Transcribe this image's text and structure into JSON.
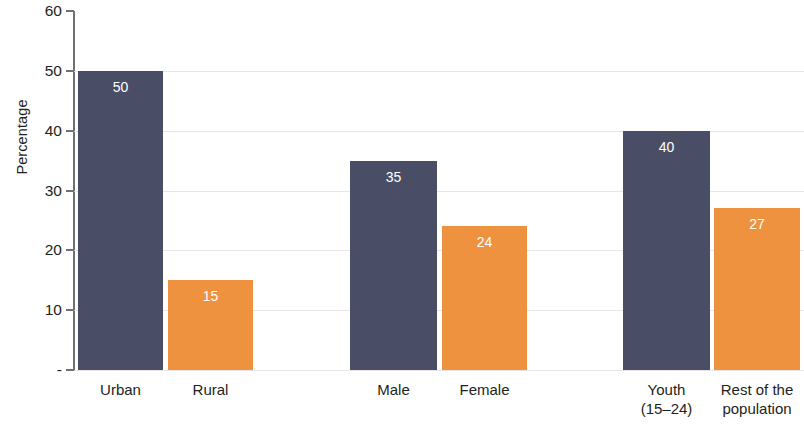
{
  "chart_data": {
    "type": "bar",
    "title": "",
    "xlabel": "",
    "ylabel": "Percentage",
    "ylim": [
      0,
      60
    ],
    "ytick_values": [
      60,
      50,
      40,
      30,
      20,
      10,
      0
    ],
    "ytick_labels": [
      "60",
      "50",
      "40",
      "30",
      "20",
      "10",
      "-"
    ],
    "grid": true,
    "legend": "none",
    "categories": [
      "Urban",
      "Rural",
      "Male",
      "Female",
      "Youth (15–24)",
      "Rest of the population"
    ],
    "category_lines": [
      [
        "Urban"
      ],
      [
        "Rural"
      ],
      [
        "Male"
      ],
      [
        "Female"
      ],
      [
        "Youth",
        "(15–24)"
      ],
      [
        "Rest of the",
        "population"
      ]
    ],
    "values": [
      50,
      15,
      35,
      24,
      40,
      27
    ],
    "data_labels": [
      "50",
      "15",
      "35",
      "24",
      "40",
      "27"
    ],
    "bar_colors": [
      "#4a4d66",
      "#ef9240",
      "#4a4d66",
      "#ef9240",
      "#4a4d66",
      "#ef9240"
    ]
  },
  "colors": {
    "navy": "#4a4d66",
    "orange": "#ef9240",
    "axis": "#6f6f74",
    "gridline": "#e3e1e4",
    "text": "#231f20",
    "value_label": "#ffffff",
    "background": "#ffffff"
  }
}
